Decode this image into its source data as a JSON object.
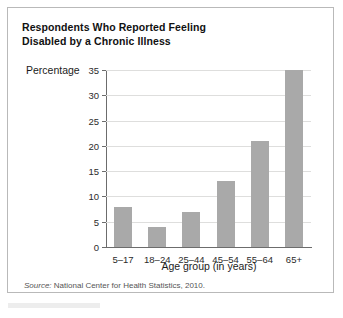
{
  "figure": {
    "title_line1": "Respondents Who Reported Feeling",
    "title_line2": "Disabled by a Chronic Illness",
    "source_prefix": "Source:",
    "source_text": " National Center for Health Statistics, 2010.",
    "bar_color": "#a9a9a9",
    "grid_color": "#dededd",
    "axis_color": "#6c6c6c",
    "border_color": "#b9b9b9"
  },
  "chart_data": {
    "type": "bar",
    "title": "Respondents Who Reported Feeling Disabled by a Chronic Illness",
    "categories": [
      "5–17",
      "18–24",
      "25–44",
      "45–54",
      "55–64",
      "65+"
    ],
    "values": [
      8,
      4,
      7,
      13,
      21,
      35
    ],
    "xlabel": "Age group (in years)",
    "ylabel": "Percentage",
    "ylim": [
      0,
      35
    ],
    "yticks": [
      0,
      5,
      10,
      15,
      20,
      25,
      30,
      35
    ],
    "ytick_labels": [
      "0",
      "5",
      "10",
      "15",
      "20",
      "25",
      "30",
      "35"
    ],
    "grid": true,
    "grid_axis": "y",
    "legend": false,
    "source": "Source: National Center for Health Statistics, 2010."
  }
}
